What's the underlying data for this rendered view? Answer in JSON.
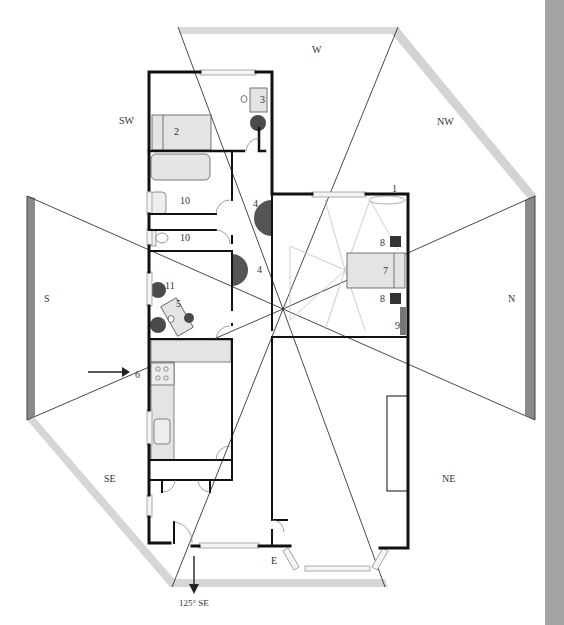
{
  "diagram": {
    "type": "floor-plan-bagua",
    "directions": {
      "w": "W",
      "nw": "NW",
      "sw": "SW",
      "s": "S",
      "n": "N",
      "se": "SE",
      "ne": "NE",
      "e": "E"
    },
    "entrance_bearing": "125° SE",
    "room_markers": {
      "m1": "1",
      "m2": "2",
      "m3": "3",
      "m4a": "4",
      "m4b": "4",
      "m5": "5",
      "m6": "6",
      "m7": "7",
      "m8a": "8",
      "m8b": "8",
      "m9": "9",
      "m10a": "10",
      "m10b": "10",
      "m11": "11"
    },
    "colors": {
      "wall": "#111111",
      "band_light": "#d6d6d6",
      "band_dark": "#8a8a8a",
      "furniture_fill": "#e6e6e6",
      "plant": "#444444",
      "door_swing": "#5a5a5a",
      "sidebar": "#a3a3a3"
    }
  }
}
